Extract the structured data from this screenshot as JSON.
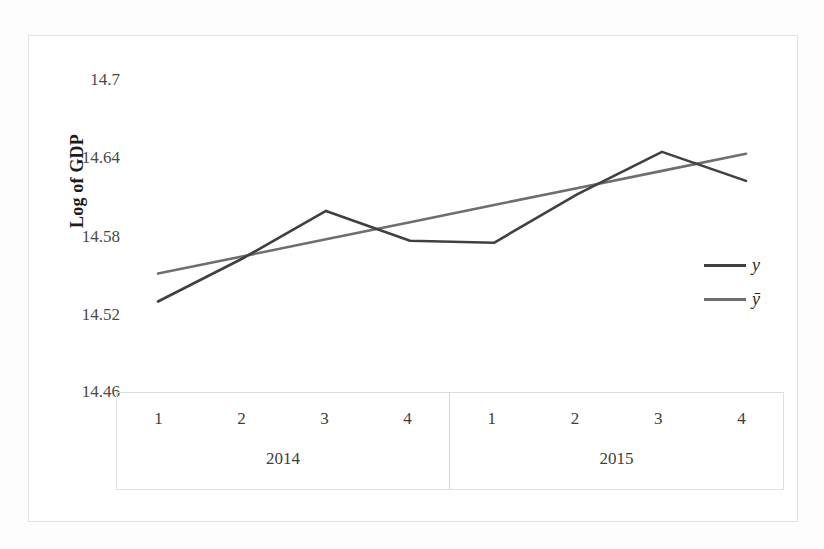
{
  "chart_data": {
    "type": "line",
    "title": "",
    "xlabel": "",
    "ylabel": "Log of GDP",
    "ylim": [
      14.46,
      14.7
    ],
    "yticks": [
      "14.7",
      "14.64",
      "14.58",
      "14.52",
      "14.46"
    ],
    "ytick_values": [
      14.7,
      14.64,
      14.58,
      14.52,
      14.46
    ],
    "grid": false,
    "legend_position": "right",
    "x": [
      "2014 Q1",
      "2014 Q2",
      "2014 Q3",
      "2014 Q4",
      "2015 Q1",
      "2015 Q2",
      "2015 Q3",
      "2015 Q4"
    ],
    "categories": [
      "1",
      "2",
      "3",
      "4",
      "1",
      "2",
      "3",
      "4"
    ],
    "groups": [
      {
        "label": "2014",
        "quarters": [
          "1",
          "2",
          "3",
          "4"
        ]
      },
      {
        "label": "2015",
        "quarters": [
          "1",
          "2",
          "3",
          "4"
        ]
      }
    ],
    "series": [
      {
        "name": "y",
        "legend_label": "y",
        "color": "#404040",
        "values": [
          14.5296,
          14.5625,
          14.5993,
          14.5763,
          14.5748,
          14.6124,
          14.6447,
          14.6224
        ]
      },
      {
        "name": "ybar",
        "legend_label": "ȳ",
        "color": "#6e6e6e",
        "values": [
          14.5511,
          14.5643,
          14.5775,
          14.5906,
          14.6038,
          14.617,
          14.6301,
          14.6433
        ]
      }
    ],
    "annotations": []
  },
  "axes": {
    "y_title": "Log of GDP"
  },
  "legend": {
    "items": [
      {
        "label": "y",
        "color": "#404040"
      },
      {
        "label": "ȳ",
        "color": "#6e6e6e"
      }
    ]
  },
  "colors": {
    "series_y": "#404040",
    "series_ybar": "#6e6e6e",
    "frame": "#e2e2e2",
    "table_border": "#e0e0e0",
    "text": "#3d3d3d"
  }
}
